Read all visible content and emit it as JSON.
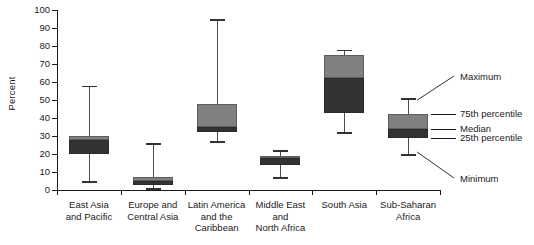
{
  "chart_data": {
    "type": "box",
    "title": "",
    "xlabel": "",
    "ylabel": "Percent",
    "ylim": [
      0,
      100
    ],
    "ytick_step": 10,
    "grid": false,
    "legend_position": "right",
    "yticks": [
      "100",
      "90",
      "80",
      "70",
      "60",
      "50",
      "40",
      "30",
      "20",
      "10",
      "0"
    ],
    "categories": [
      "East Asia and Pacific",
      "Europe and Central Asia",
      "Latin America and the Caribbean",
      "Middle East and North Africa",
      "South Asia",
      "Sub-Saharan Africa"
    ],
    "category_lines": [
      [
        "East Asia",
        "and Pacific"
      ],
      [
        "Europe and",
        "Central Asia"
      ],
      [
        "Latin America",
        "and the",
        "Caribbean"
      ],
      [
        "Middle East",
        "and",
        "North Africa"
      ],
      [
        "South Asia"
      ],
      [
        "Sub-Saharan",
        "Africa"
      ]
    ],
    "boxes": [
      {
        "name": "East Asia and Pacific",
        "min": 5,
        "q1": 20,
        "median": 28,
        "q3": 30,
        "max": 58
      },
      {
        "name": "Europe and Central Asia",
        "min": 1,
        "q1": 3,
        "median": 5,
        "q3": 7,
        "max": 26
      },
      {
        "name": "Latin America and the Caribbean",
        "min": 27,
        "q1": 32,
        "median": 35,
        "q3": 48,
        "max": 95
      },
      {
        "name": "Middle East and North Africa",
        "min": 7,
        "q1": 14,
        "median": 18,
        "q3": 19,
        "max": 22
      },
      {
        "name": "South Asia",
        "min": 32,
        "q1": 43,
        "median": 62,
        "q3": 75,
        "max": 78
      },
      {
        "name": "Sub-Saharan Africa",
        "min": 20,
        "q1": 29,
        "median": 34,
        "q3": 42,
        "max": 51
      }
    ],
    "annotations": [
      {
        "key": "maximum",
        "label": "Maximum"
      },
      {
        "key": "p75",
        "label": "75th percentile"
      },
      {
        "key": "median",
        "label": "Median"
      },
      {
        "key": "p25",
        "label": "25th percentile"
      },
      {
        "key": "minimum",
        "label": "Minimum"
      }
    ],
    "colors": {
      "box_upper": "#808080",
      "box_lower": "#333333",
      "whisker": "#4d4d4d",
      "axis": "#1a1a1a",
      "background": "#ffffff"
    }
  }
}
